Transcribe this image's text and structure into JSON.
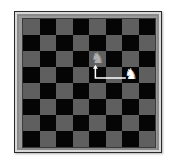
{
  "board": {
    "rows": 8,
    "cols": 8,
    "top_left_color": "light",
    "colors": {
      "light": "#5f5f5f",
      "dark": "#050505",
      "frame": "#9a9a9a"
    }
  },
  "pieces": [
    {
      "name": "knight",
      "color": "white",
      "glyph": "♞",
      "row": 3,
      "col": 6,
      "state": "current"
    },
    {
      "name": "knight",
      "color": "white",
      "glyph": "♞",
      "row": 2,
      "col": 4,
      "state": "ghost-destination"
    }
  ],
  "move_arrow": {
    "from": {
      "row": 3,
      "col": 6
    },
    "to": {
      "row": 2,
      "col": 4
    },
    "shape": "L",
    "color": "#ffffff"
  }
}
